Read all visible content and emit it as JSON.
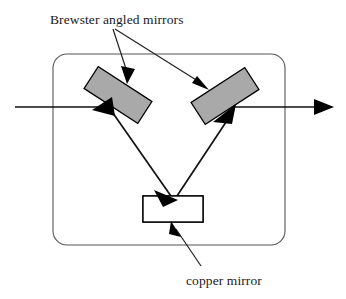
{
  "figure": {
    "background_color": "#ffffff",
    "width": 346,
    "height": 299
  },
  "labels": {
    "brewster": "Brewster angled mirrors",
    "copper": "copper mirror"
  },
  "colors": {
    "mirror_fill": "#a9a9a9",
    "mirror_stroke": "#000000",
    "beam": "#111111",
    "enclosure": "#555555",
    "text": "#1a1a1a",
    "copper_mirror_fill": "#ffffff",
    "hatch": "#000000"
  },
  "components": [
    {
      "name": "left-brewster-mirror",
      "type": "rotated-rectangle",
      "fill": "#a9a9a9",
      "rotation_deg": 33,
      "center_x": 118,
      "center_y": 95,
      "width": 64,
      "height": 26
    },
    {
      "name": "right-brewster-mirror",
      "type": "rotated-rectangle",
      "fill": "#a9a9a9",
      "rotation_deg": -33,
      "center_x": 225,
      "center_y": 96,
      "width": 64,
      "height": 26
    },
    {
      "name": "copper-mirror",
      "type": "hatched-rectangle",
      "fill": "#ffffff",
      "x": 143,
      "y": 196,
      "width": 60,
      "height": 26
    }
  ],
  "enclosure": {
    "name": "cavity-enclosure",
    "x": 53,
    "y": 54,
    "width": 232,
    "height": 191,
    "corner_radius": 14
  },
  "beam_path": {
    "description": "Input beam enters from left, reflects off left Brewster mirror down to copper mirror, up to right Brewster mirror, and exits right",
    "segments": [
      {
        "name": "input-beam",
        "x1": 15,
        "y1": 107,
        "x2": 112,
        "y2": 107
      },
      {
        "name": "left-mirror-to-copper",
        "x1": 110,
        "y1": 108,
        "x2": 172,
        "y2": 197
      },
      {
        "name": "copper-to-right-mirror",
        "x1": 176,
        "y1": 197,
        "x2": 231,
        "y2": 112
      },
      {
        "name": "output-beam",
        "x1": 228,
        "y1": 107,
        "x2": 335,
        "y2": 107
      }
    ],
    "arrow_points": [
      {
        "name": "left-mirror-hit",
        "x": 102,
        "y": 112,
        "angle_deg": 200
      },
      {
        "name": "copper-mirror-hit",
        "x": 174,
        "y": 199,
        "angle_deg": 55
      },
      {
        "name": "right-mirror-hit",
        "x": 233,
        "y": 109,
        "angle_deg": -57
      },
      {
        "name": "output-exit",
        "x": 335,
        "y": 107,
        "angle_deg": 0
      }
    ]
  },
  "annotations": [
    {
      "name": "brewster-leader-left",
      "from_x": 113,
      "from_y": 29,
      "to_x": 127,
      "to_y": 82
    },
    {
      "name": "brewster-leader-right",
      "from_x": 115,
      "from_y": 29,
      "to_x": 207,
      "to_y": 88
    },
    {
      "name": "copper-leader",
      "from_x": 201,
      "from_y": 266,
      "to_x": 172,
      "to_y": 223
    }
  ],
  "label_positions": {
    "brewster_x": 50,
    "brewster_y": 24,
    "copper_x": 186,
    "copper_y": 285
  }
}
